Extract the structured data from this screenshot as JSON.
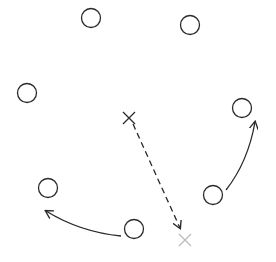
{
  "diagram": {
    "type": "play-diagram",
    "stroke_color": "#2a2a2a",
    "faint_color": "#bbbbbb",
    "players": [
      {
        "id": "p1",
        "x": 91,
        "y": 18
      },
      {
        "id": "p2",
        "x": 190,
        "y": 25
      },
      {
        "id": "p3",
        "x": 27,
        "y": 93
      },
      {
        "id": "p4",
        "x": 242,
        "y": 108
      },
      {
        "id": "p5",
        "x": 48,
        "y": 188
      },
      {
        "id": "p6",
        "x": 213,
        "y": 195
      },
      {
        "id": "p7",
        "x": 134,
        "y": 229
      }
    ],
    "markers": [
      {
        "id": "x-start",
        "x": 129,
        "y": 118,
        "style": "solid"
      },
      {
        "id": "x-end",
        "x": 185,
        "y": 240,
        "style": "faint"
      }
    ],
    "paths": [
      {
        "id": "dashed-run",
        "style": "dashed",
        "d": "M133 124 L180 228"
      },
      {
        "id": "curve-right",
        "style": "solid",
        "d": "M226 190 Q248 162 255 122"
      },
      {
        "id": "curve-left",
        "style": "solid",
        "d": "M121 236 Q80 232 46 211"
      }
    ]
  }
}
